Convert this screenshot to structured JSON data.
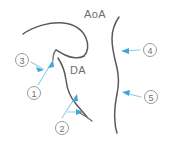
{
  "figure": {
    "kind": "anatomical-line-diagram",
    "width": 174,
    "height": 143,
    "background_color": "#ffffff",
    "vessel_stroke_color": "#5a5a5a",
    "arrow_color": "#3fa6d8",
    "leader_color": "#8fcdea",
    "marker_outline_color": "#9a9a9a",
    "label_text_color": "#6e6e6e"
  },
  "anatomy_labels": [
    {
      "id": "aoa",
      "text": "AoA",
      "name": "aortic-arch-label"
    },
    {
      "id": "da",
      "text": "DA",
      "name": "ductus-arteriosus-label"
    }
  ],
  "markers": [
    {
      "id": "m1",
      "text": "1",
      "name": "marker-1"
    },
    {
      "id": "m2",
      "text": "2",
      "name": "marker-2"
    },
    {
      "id": "m3",
      "text": "3",
      "name": "marker-3"
    },
    {
      "id": "m4",
      "text": "4",
      "name": "marker-4"
    },
    {
      "id": "m5",
      "text": "5",
      "name": "marker-5"
    }
  ]
}
